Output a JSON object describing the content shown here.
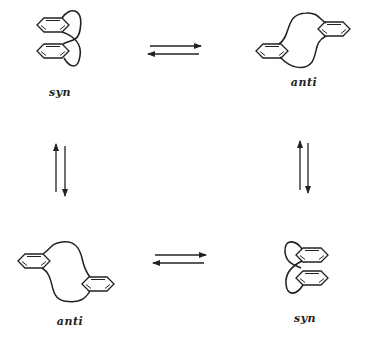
{
  "diagram": {
    "type": "conformational-equilibrium",
    "colors": {
      "ink": "#222222",
      "background": "#ffffff"
    },
    "structures": [
      {
        "id": "top-left",
        "label": "syn",
        "conformation": "syn",
        "label_pos": [
          60,
          86
        ]
      },
      {
        "id": "top-right",
        "label": "anti",
        "conformation": "anti",
        "label_pos": [
          304,
          76
        ]
      },
      {
        "id": "bottom-left",
        "label": "anti",
        "conformation": "anti",
        "label_pos": [
          70,
          315
        ]
      },
      {
        "id": "bottom-right",
        "label": "syn",
        "conformation": "syn",
        "label_pos": [
          305,
          312
        ]
      }
    ],
    "equilibria": [
      {
        "from": "top-left",
        "to": "top-right",
        "orientation": "horizontal"
      },
      {
        "from": "top-left",
        "to": "bottom-left",
        "orientation": "vertical"
      },
      {
        "from": "top-right",
        "to": "bottom-right",
        "orientation": "vertical"
      },
      {
        "from": "bottom-left",
        "to": "bottom-right",
        "orientation": "horizontal"
      }
    ]
  }
}
